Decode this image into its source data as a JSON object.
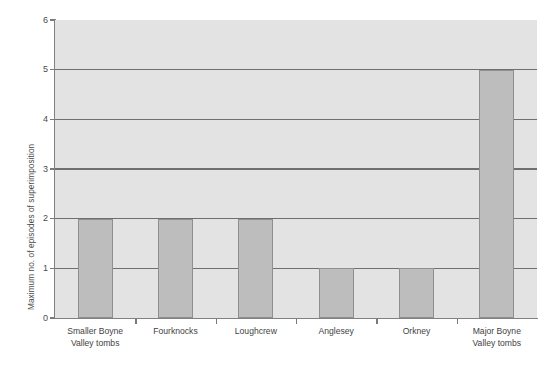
{
  "chart_data": {
    "type": "bar",
    "title": "",
    "subtitle": "",
    "xlabel": "",
    "ylabel": "Maximum no. of episodes of superimposition",
    "ylim": [
      0,
      6
    ],
    "ytick_labels": [
      "0",
      "1",
      "2",
      "3",
      "4",
      "5",
      "6"
    ],
    "ytick_values": [
      0,
      1,
      2,
      3,
      4,
      5,
      6
    ],
    "grid": true,
    "gridlines_at": [
      1,
      2,
      3,
      4,
      5
    ],
    "legend": null,
    "legend_position": "none",
    "categories": [
      "Smaller Boyne Valley tombs",
      "Fourknocks",
      "Loughcrew",
      "Anglesey",
      "Orkney",
      "Major Boyne Valley tombs"
    ],
    "category_lines": [
      [
        "Smaller Boyne",
        "Valley tombs"
      ],
      [
        "Fourknocks"
      ],
      [
        "Loughcrew"
      ],
      [
        "Anglesey"
      ],
      [
        "Orkney"
      ],
      [
        "Major Boyne",
        "Valley tombs"
      ]
    ],
    "values": [
      2,
      2,
      2,
      1,
      1,
      5
    ],
    "bar_color": "#bdbdbd",
    "bar_edge_color": "#8f8f8f",
    "plot_background": "#e3e3e3",
    "gridline_color": "#6f6f6f",
    "axis_color": "#808080",
    "text_color": "#3f3f3f",
    "page_background": "#ffffff"
  }
}
